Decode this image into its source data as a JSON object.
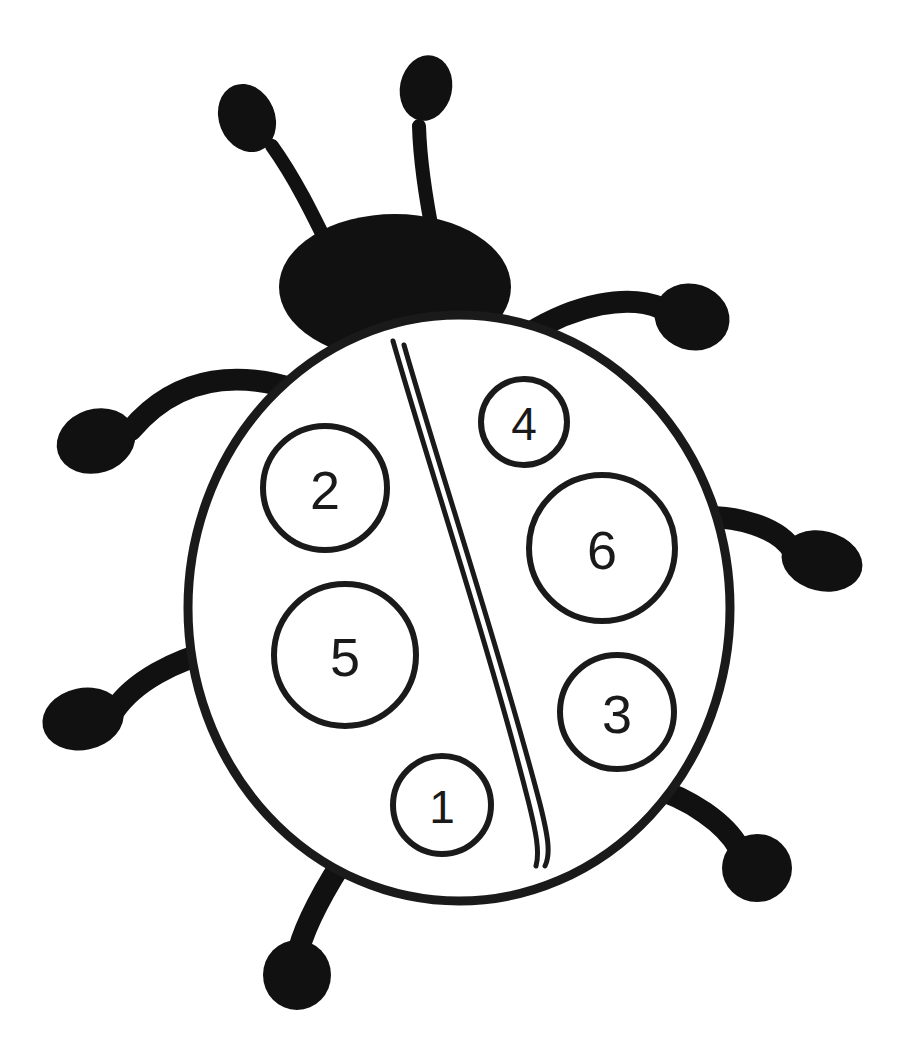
{
  "page": {
    "background_color": "#ffffff",
    "ink_color": "#111111",
    "width": 910,
    "height": 1063
  },
  "artwork": {
    "subject": "ladybug",
    "style": "black-and-white line art coloring page",
    "outline_color": "#1a1a1a",
    "fill_color": "#ffffff",
    "solid_color": "#111111"
  },
  "body": {
    "label": "ladybug-body-shell",
    "center_x": 459,
    "center_y": 608,
    "radius_x": 271,
    "radius_y": 293,
    "stroke_width": 9
  },
  "head": {
    "label": "ladybug-head",
    "center_x": 395,
    "center_y": 287,
    "radius_x": 116,
    "radius_y": 73
  },
  "wing_split": {
    "label": "wing-divider-double-line",
    "start_x": 393,
    "start_y": 340,
    "end_x": 543,
    "end_y": 866,
    "line_count": 2
  },
  "antennae": [
    {
      "name": "antenna-left",
      "tip_x": 247,
      "tip_y": 118,
      "knob_radius_x": 28,
      "knob_radius_y": 35,
      "knob_rotation": -22,
      "stroke_width": 14
    },
    {
      "name": "antenna-right",
      "tip_x": 426,
      "tip_y": 88,
      "knob_radius_x": 26,
      "knob_radius_y": 33,
      "knob_rotation": 12,
      "stroke_width": 14
    }
  ],
  "legs": [
    {
      "name": "leg-upper-left",
      "foot_x": 96,
      "foot_y": 441,
      "foot_radius_x": 40,
      "foot_radius_y": 32,
      "foot_rotation": -18,
      "stroke_width": 22
    },
    {
      "name": "leg-lower-left",
      "foot_x": 83,
      "foot_y": 719,
      "foot_radius_x": 41,
      "foot_radius_y": 31,
      "foot_rotation": -12,
      "stroke_width": 22
    },
    {
      "name": "leg-bottom-left",
      "foot_x": 297,
      "foot_y": 975,
      "foot_radius_x": 34,
      "foot_radius_y": 35,
      "foot_rotation": 0,
      "stroke_width": 22
    },
    {
      "name": "leg-upper-right",
      "foot_x": 692,
      "foot_y": 317,
      "foot_radius_x": 38,
      "foot_radius_y": 33,
      "foot_rotation": 18,
      "stroke_width": 22
    },
    {
      "name": "leg-lower-right",
      "foot_x": 822,
      "foot_y": 561,
      "foot_radius_x": 41,
      "foot_radius_y": 30,
      "foot_rotation": 14,
      "stroke_width": 22
    },
    {
      "name": "leg-bottom-right",
      "foot_x": 757,
      "foot_y": 868,
      "foot_radius_x": 35,
      "foot_radius_y": 34,
      "foot_rotation": 0,
      "stroke_width": 22
    }
  ],
  "spots": [
    {
      "name": "spot-2",
      "number": "2",
      "wing": "left",
      "center_x": 325,
      "center_y": 488,
      "radius": 62,
      "stroke_width": 6,
      "font_size": 54
    },
    {
      "name": "spot-5",
      "number": "5",
      "wing": "left",
      "center_x": 345,
      "center_y": 655,
      "radius": 71,
      "stroke_width": 6,
      "font_size": 54
    },
    {
      "name": "spot-1",
      "number": "1",
      "wing": "left",
      "center_x": 442,
      "center_y": 805,
      "radius": 49,
      "stroke_width": 6,
      "font_size": 46
    },
    {
      "name": "spot-4",
      "number": "4",
      "wing": "right",
      "center_x": 524,
      "center_y": 422,
      "radius": 43,
      "stroke_width": 6,
      "font_size": 46
    },
    {
      "name": "spot-6",
      "number": "6",
      "wing": "right",
      "center_x": 602,
      "center_y": 548,
      "radius": 73,
      "stroke_width": 6,
      "font_size": 54
    },
    {
      "name": "spot-3",
      "number": "3",
      "wing": "right",
      "center_x": 617,
      "center_y": 712,
      "radius": 57,
      "stroke_width": 6,
      "font_size": 54
    }
  ],
  "summary": {
    "spot_count": 6,
    "leg_count": 6,
    "antenna_count": 2,
    "numbers_shown": [
      "1",
      "2",
      "3",
      "4",
      "5",
      "6"
    ]
  }
}
